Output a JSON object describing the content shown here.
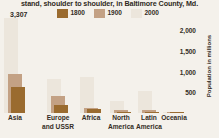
{
  "title": "stand, shoulder to shoulder, in Baltimore County, Md.",
  "colors": {
    "background": "#f4f1eb",
    "c1800": "#9a6b2f",
    "c1900": "#c3a184",
    "c2000": "#ece6dc",
    "text": "#332c24"
  },
  "legend": {
    "position": "top-center",
    "items": [
      {
        "label": "1800",
        "color": "#9a6b2f",
        "swatch": "legend-swatch-1800"
      },
      {
        "label": "1900",
        "color": "#c3a184",
        "swatch": "legend-swatch-1900"
      },
      {
        "label": "2000",
        "color": "#ece6dc",
        "swatch": "legend-swatch-2000"
      }
    ]
  },
  "callout": {
    "value": "3,307"
  },
  "axis": {
    "ylabel": "Population in millions",
    "ticks": [
      "2,000",
      "1,500",
      "1,000",
      "500"
    ],
    "tick_values": [
      2000,
      1500,
      1000,
      500
    ],
    "ymin": 0,
    "ymax": 2300
  },
  "categories": [
    {
      "line1": "Asia",
      "line2": ""
    },
    {
      "line1": "Europe",
      "line2": "and USSR"
    },
    {
      "line1": "Africa",
      "line2": ""
    },
    {
      "line1": "North",
      "line2": "America"
    },
    {
      "line1": "Latin",
      "line2": "America"
    },
    {
      "line1": "Oceania",
      "line2": ""
    }
  ],
  "chart_data": {
    "type": "bar",
    "title": "stand, shoulder to shoulder, in Baltimore County, Md.",
    "xlabel": "",
    "ylabel": "Population in millions",
    "ylim": [
      0,
      2300
    ],
    "grid": false,
    "legend_position": "top-center",
    "categories": [
      "Asia",
      "Europe and USSR",
      "Africa",
      "North America",
      "Latin America",
      "Oceania"
    ],
    "series": [
      {
        "name": "1800",
        "color": "#9a6b2f",
        "values": [
          635,
          203,
          107,
          7,
          24,
          2
        ]
      },
      {
        "name": "1900",
        "color": "#c3a184",
        "values": [
          947,
          408,
          133,
          82,
          74,
          6
        ]
      },
      {
        "name": "2000",
        "color": "#ece6dc",
        "values": [
          3307,
          818,
          872,
          295,
          540,
          30
        ]
      }
    ],
    "annotations": [
      {
        "text": "3,307",
        "series": "2000",
        "category": "Asia",
        "value": 3307,
        "note": "bar exceeds axis maximum"
      }
    ]
  }
}
